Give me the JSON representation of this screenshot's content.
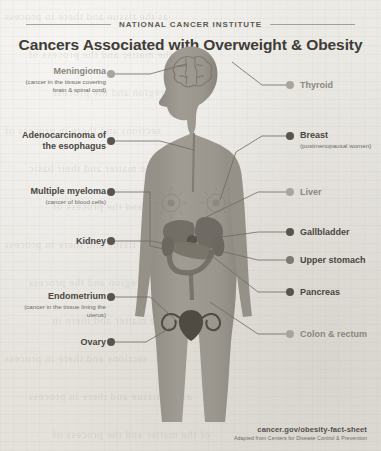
{
  "header": {
    "kicker": "NATIONAL CANCER INSTITUTE",
    "title": "Cancers Associated with Overweight & Obesity"
  },
  "colors": {
    "paper": "#e9e7e2",
    "body_silhouette": "#9d9890",
    "body_shadow": "#8b867e",
    "ink_dark": "#4a4641",
    "ink_light": "#8b867e",
    "dot_dark": "#59544d",
    "dot_light": "#a9a49c",
    "connector": "#6f6b64"
  },
  "labels_left": [
    {
      "name": "Meningioma",
      "sub": "(cancer in the tissue covering brain & spinal cord)",
      "emphasis": "light",
      "dot": "light"
    },
    {
      "name": "Adenocarcinoma of the esophagus",
      "sub": "",
      "emphasis": "dark",
      "dot": "dark"
    },
    {
      "name": "Multiple myeloma",
      "sub": "(cancer of blood cells)",
      "emphasis": "dark",
      "dot": "dark"
    },
    {
      "name": "Kidney",
      "sub": "",
      "emphasis": "dark",
      "dot": "dark"
    },
    {
      "name": "Endometrium",
      "sub": "(cancer in the tissue lining the uterus)",
      "emphasis": "dark",
      "dot": "dark"
    },
    {
      "name": "Ovary",
      "sub": "",
      "emphasis": "dark",
      "dot": "dark"
    }
  ],
  "labels_right": [
    {
      "name": "Thyroid",
      "sub": "",
      "emphasis": "light",
      "dot": "light"
    },
    {
      "name": "Breast",
      "sub": "(postmenopausal women)",
      "emphasis": "dark",
      "dot": "dark"
    },
    {
      "name": "Liver",
      "sub": "",
      "emphasis": "light",
      "dot": "light"
    },
    {
      "name": "Gallbladder",
      "sub": "",
      "emphasis": "dark",
      "dot": "dark"
    },
    {
      "name": "Upper stomach",
      "sub": "",
      "emphasis": "dark",
      "dot": "mid"
    },
    {
      "name": "Pancreas",
      "sub": "",
      "emphasis": "dark",
      "dot": "dark"
    },
    {
      "name": "Colon & rectum",
      "sub": "",
      "emphasis": "light",
      "dot": "light"
    }
  ],
  "figure": {
    "organs": [
      "brain",
      "esophagus",
      "breasts",
      "liver",
      "gallbladder",
      "stomach",
      "pancreas",
      "kidneys",
      "colon",
      "uterus",
      "ovaries"
    ]
  },
  "footer": {
    "url": "cancer.gov/obesity-fact-sheet",
    "source": "Adapted from Centers for Disease Control & Prevention"
  },
  "ghost_text": [
    "as the tissue and there in process",
    "of the matter and the process of",
    "in the region and the process",
    "sections and there in process of",
    "the matter and their basic",
    "in a region and the process of",
    "the tissue and there in process",
    "a region and the process",
    "of the matter and there in",
    "sections and there in process"
  ]
}
